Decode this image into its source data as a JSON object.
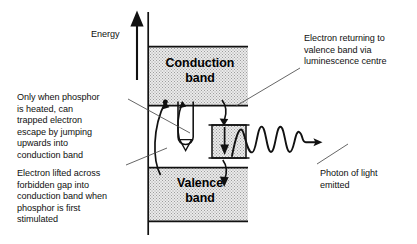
{
  "figure": {
    "type": "energy-band-diagram",
    "axis": {
      "energy_label": "Energy",
      "direction": "up"
    },
    "bands": [
      {
        "id": "conduction",
        "label": "Conduction\nband",
        "label_line1": "Conduction",
        "label_line2": "band"
      },
      {
        "id": "valence",
        "label": "Valence\nband",
        "label_line1": "Valence",
        "label_line2": "band"
      }
    ],
    "trap": {
      "id": "luminescence-centre",
      "label": ""
    },
    "annotations": [
      {
        "id": "heated-escape",
        "text": "Only when phosphor\nis heated, can\ntrapped electron\nescape by jumping\nupwards into\nconduction band"
      },
      {
        "id": "electron-lifted",
        "text": "Electron lifted across\nforbidden gap into\nconduction band when\nphosphor is first\nstimulated"
      },
      {
        "id": "electron-returning",
        "text": "Electron returning to\nvalence band via\nluminescence centre"
      },
      {
        "id": "photon-emitted",
        "text": "Photon of light\nemitted"
      }
    ],
    "colors": {
      "ink": "#111111",
      "band_fill": "#e3e3e3",
      "band_stipple": "#9a9a9a",
      "background": "#ffffff"
    }
  }
}
